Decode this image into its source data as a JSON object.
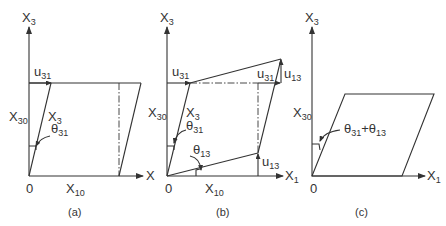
{
  "panels": [
    {
      "id": "a",
      "caption": "(a)",
      "axes": {
        "vertical": "X",
        "vertical_sub": "3",
        "horizontal": "X",
        "horizontal_sub": "1",
        "origin": "0"
      },
      "labels": {
        "u31": {
          "main": "u",
          "sub": "31"
        },
        "x30": {
          "main": "X",
          "sub": "30"
        },
        "x3": {
          "main": "X",
          "sub": "3"
        },
        "theta31": {
          "main": "θ",
          "sub": "31"
        },
        "x10": {
          "main": "X",
          "sub": "10"
        }
      }
    },
    {
      "id": "b",
      "caption": "(b)",
      "axes": {
        "vertical": "X",
        "vertical_sub": "3",
        "horizontal": "X",
        "horizontal_sub": "1",
        "origin": "0"
      },
      "labels": {
        "u31_left": {
          "main": "u",
          "sub": "31"
        },
        "u31_right": {
          "main": "u",
          "sub": "31"
        },
        "u13_top": {
          "main": "u",
          "sub": "13"
        },
        "u13_bottom": {
          "main": "u",
          "sub": "13"
        },
        "x30": {
          "main": "X",
          "sub": "30"
        },
        "x3": {
          "main": "X",
          "sub": "3"
        },
        "theta31": {
          "main": "θ",
          "sub": "31"
        },
        "theta13": {
          "main": "θ",
          "sub": "13"
        },
        "x10": {
          "main": "X",
          "sub": "10"
        }
      }
    },
    {
      "id": "c",
      "caption": "(c)",
      "axes": {
        "vertical": "X",
        "vertical_sub": "3",
        "horizontal": "X",
        "horizontal_sub": "1",
        "origin": "0"
      },
      "labels": {
        "x30": {
          "main": "X",
          "sub": "30"
        },
        "theta_sum": {
          "main1": "θ",
          "sub1": "31",
          "plus": "+",
          "main2": "θ",
          "sub2": "13"
        }
      }
    }
  ],
  "colors": {
    "line": "#333333",
    "background": "#ffffff"
  }
}
